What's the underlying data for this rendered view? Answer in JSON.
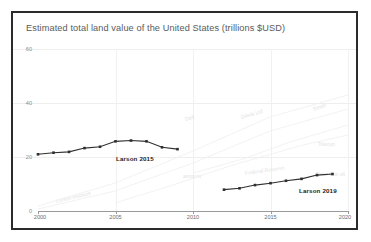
{
  "chart_data": {
    "type": "line",
    "title": "Estimated total land value of the United States (trillions $USD)",
    "xlabel": "",
    "ylabel": "",
    "xlim": [
      2000,
      2020
    ],
    "ylim": [
      0,
      60
    ],
    "xticks": [
      2000,
      2005,
      2010,
      2015,
      2020
    ],
    "yticks": [
      0,
      20,
      40,
      60
    ],
    "grid": true,
    "legend_position": "inline-annotation",
    "series": [
      {
        "name": "Larson 2015",
        "color": "#2f2f2f",
        "x": [
          2000,
          2001,
          2002,
          2003,
          2004,
          2005,
          2006,
          2007,
          2008,
          2009
        ],
        "values": [
          21.0,
          21.6,
          21.9,
          23.3,
          23.8,
          25.8,
          26.1,
          25.8,
          23.6,
          22.9
        ]
      },
      {
        "name": "Larson 2019",
        "color": "#2f2f2f",
        "x": [
          2012,
          2013,
          2014,
          2015,
          2016,
          2017,
          2018,
          2019
        ],
        "values": [
          7.9,
          8.4,
          9.6,
          10.3,
          11.2,
          11.9,
          13.3,
          13.7
        ]
      }
    ],
    "background_series_labels": [
      "Lorem Institute",
      "Dell",
      "Davis Ltd",
      "Smith",
      "Tokoyo",
      "amount",
      "Federal Reserve",
      "Price low ult"
    ]
  },
  "axis": {
    "ytick_labels": [
      "0",
      "20",
      "40",
      "60"
    ],
    "xtick_labels": [
      "2000",
      "2005",
      "2010",
      "2015",
      "2020"
    ]
  },
  "annotations": {
    "larson_2015": "Larson 2015",
    "larson_2019": "Larson 2019"
  },
  "colors": {
    "frame": "#2b2b2b",
    "series": "#2f2f2f",
    "grid": "#eeeeee",
    "axis": "#9a9a9a",
    "title_text": "#5a5a5a",
    "ghost": "#e3e3e3"
  }
}
